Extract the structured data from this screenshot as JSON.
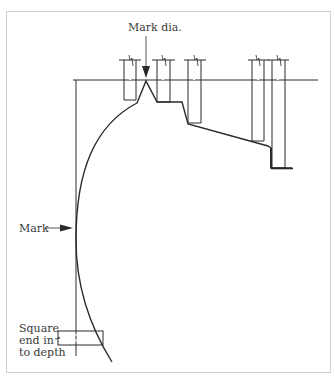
{
  "diagram": {
    "type": "technical drawing - turned profile with depth-marking cuts",
    "labels": {
      "mark_dia": "Mark dia.",
      "mark": "Mark",
      "square_end": [
        "Square",
        "end in",
        "to depth"
      ]
    },
    "colors": {
      "line": "#2a2a2a",
      "frame": "#cfcfcf",
      "text": "#3a3a3a",
      "background": "#ffffff"
    }
  }
}
